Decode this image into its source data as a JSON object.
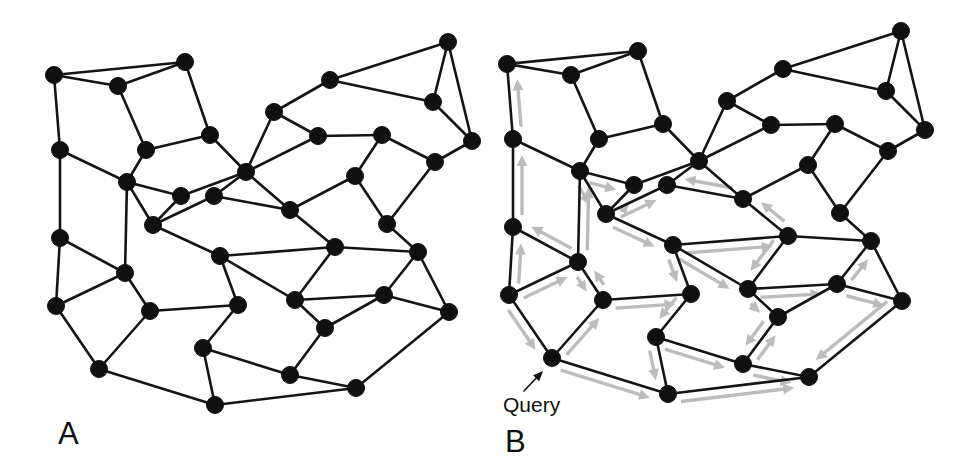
{
  "figure": {
    "background_color": "#ffffff",
    "width": 976,
    "height": 475
  },
  "style": {
    "edge_color": "#141414",
    "node_color": "#101010",
    "arrow_color": "#bcbcbc",
    "text_color": "#111111",
    "node_radius": 8.5,
    "edge_width": 2.6,
    "arrow_width": 3.4
  },
  "panels": [
    {
      "id": "panel-a",
      "label": "A",
      "label_x": 58,
      "label_y": 444,
      "offset_x": 0,
      "offset_y": 0,
      "show_arrows": false,
      "show_query": false
    },
    {
      "id": "panel-b",
      "label": "B",
      "label_x": 505,
      "label_y": 452,
      "offset_x": 453,
      "offset_y": -11,
      "show_arrows": true,
      "show_query": true
    }
  ],
  "query_annotation": {
    "label": "Query",
    "label_x": 503,
    "label_y": 412,
    "pointer_from_x": 524,
    "pointer_from_y": 391,
    "pointer_to_x": 543,
    "pointer_to_y": 371,
    "target_node": 30
  },
  "graph": {
    "node_count": 38,
    "nodes": [
      {
        "id": 0,
        "x": 54,
        "y": 75
      },
      {
        "id": 1,
        "x": 118,
        "y": 86
      },
      {
        "id": 2,
        "x": 185,
        "y": 62
      },
      {
        "id": 3,
        "x": 146,
        "y": 150
      },
      {
        "id": 4,
        "x": 210,
        "y": 135
      },
      {
        "id": 5,
        "x": 60,
        "y": 150
      },
      {
        "id": 6,
        "x": 127,
        "y": 182
      },
      {
        "id": 7,
        "x": 246,
        "y": 172
      },
      {
        "id": 8,
        "x": 181,
        "y": 196
      },
      {
        "id": 9,
        "x": 274,
        "y": 112
      },
      {
        "id": 10,
        "x": 330,
        "y": 80
      },
      {
        "id": 11,
        "x": 448,
        "y": 42
      },
      {
        "id": 12,
        "x": 433,
        "y": 102
      },
      {
        "id": 13,
        "x": 472,
        "y": 141
      },
      {
        "id": 14,
        "x": 435,
        "y": 162
      },
      {
        "id": 15,
        "x": 382,
        "y": 135
      },
      {
        "id": 16,
        "x": 318,
        "y": 136
      },
      {
        "id": 17,
        "x": 355,
        "y": 176
      },
      {
        "id": 18,
        "x": 60,
        "y": 238
      },
      {
        "id": 19,
        "x": 153,
        "y": 225
      },
      {
        "id": 20,
        "x": 214,
        "y": 196
      },
      {
        "id": 21,
        "x": 290,
        "y": 210
      },
      {
        "id": 22,
        "x": 387,
        "y": 224
      },
      {
        "id": 23,
        "x": 335,
        "y": 247
      },
      {
        "id": 24,
        "x": 418,
        "y": 252
      },
      {
        "id": 25,
        "x": 125,
        "y": 273
      },
      {
        "id": 26,
        "x": 220,
        "y": 256
      },
      {
        "id": 27,
        "x": 295,
        "y": 300
      },
      {
        "id": 28,
        "x": 384,
        "y": 295
      },
      {
        "id": 29,
        "x": 449,
        "y": 312
      },
      {
        "id": 30,
        "x": 56,
        "y": 306
      },
      {
        "id": 31,
        "x": 150,
        "y": 311
      },
      {
        "id": 32,
        "x": 238,
        "y": 305
      },
      {
        "id": 33,
        "x": 325,
        "y": 328
      },
      {
        "id": 34,
        "x": 99,
        "y": 369
      },
      {
        "id": 35,
        "x": 203,
        "y": 348
      },
      {
        "id": 36,
        "x": 215,
        "y": 405
      },
      {
        "id": 37,
        "x": 290,
        "y": 375
      },
      {
        "id": 38,
        "x": 356,
        "y": 388
      }
    ],
    "edges": [
      [
        0,
        1
      ],
      [
        0,
        2
      ],
      [
        0,
        5
      ],
      [
        1,
        2
      ],
      [
        1,
        3
      ],
      [
        2,
        4
      ],
      [
        3,
        4
      ],
      [
        3,
        6
      ],
      [
        4,
        7
      ],
      [
        5,
        6
      ],
      [
        5,
        18
      ],
      [
        6,
        8
      ],
      [
        6,
        19
      ],
      [
        6,
        25
      ],
      [
        7,
        8
      ],
      [
        7,
        16
      ],
      [
        7,
        20
      ],
      [
        7,
        21
      ],
      [
        8,
        19
      ],
      [
        9,
        10
      ],
      [
        9,
        7
      ],
      [
        9,
        16
      ],
      [
        10,
        11
      ],
      [
        10,
        12
      ],
      [
        11,
        12
      ],
      [
        11,
        13
      ],
      [
        12,
        13
      ],
      [
        13,
        14
      ],
      [
        14,
        15
      ],
      [
        14,
        22
      ],
      [
        15,
        16
      ],
      [
        15,
        17
      ],
      [
        17,
        21
      ],
      [
        17,
        22
      ],
      [
        18,
        25
      ],
      [
        18,
        30
      ],
      [
        19,
        20
      ],
      [
        19,
        26
      ],
      [
        20,
        21
      ],
      [
        21,
        23
      ],
      [
        22,
        24
      ],
      [
        23,
        24
      ],
      [
        23,
        26
      ],
      [
        23,
        27
      ],
      [
        24,
        28
      ],
      [
        24,
        29
      ],
      [
        25,
        31
      ],
      [
        25,
        30
      ],
      [
        26,
        27
      ],
      [
        26,
        32
      ],
      [
        27,
        28
      ],
      [
        27,
        33
      ],
      [
        28,
        29
      ],
      [
        28,
        33
      ],
      [
        29,
        38
      ],
      [
        30,
        34
      ],
      [
        31,
        32
      ],
      [
        31,
        34
      ],
      [
        32,
        35
      ],
      [
        33,
        37
      ],
      [
        34,
        36
      ],
      [
        35,
        36
      ],
      [
        35,
        37
      ],
      [
        36,
        38
      ],
      [
        37,
        38
      ]
    ],
    "flow_arrows": [
      [
        30,
        18
      ],
      [
        18,
        5
      ],
      [
        5,
        0
      ],
      [
        30,
        25
      ],
      [
        25,
        18
      ],
      [
        25,
        6
      ],
      [
        6,
        3
      ],
      [
        6,
        8
      ],
      [
        6,
        19
      ],
      [
        19,
        8
      ],
      [
        19,
        20
      ],
      [
        19,
        26
      ],
      [
        25,
        31
      ],
      [
        31,
        32
      ],
      [
        30,
        34
      ],
      [
        34,
        36
      ],
      [
        34,
        31
      ],
      [
        31,
        25
      ],
      [
        26,
        23
      ],
      [
        26,
        27
      ],
      [
        26,
        32
      ],
      [
        32,
        35
      ],
      [
        35,
        36
      ],
      [
        35,
        37
      ],
      [
        36,
        38
      ],
      [
        37,
        33
      ],
      [
        27,
        33
      ],
      [
        27,
        28
      ],
      [
        28,
        29
      ],
      [
        28,
        24
      ],
      [
        29,
        38
      ],
      [
        33,
        37
      ],
      [
        23,
        21
      ],
      [
        21,
        20
      ],
      [
        23,
        27
      ],
      [
        37,
        38
      ]
    ]
  }
}
